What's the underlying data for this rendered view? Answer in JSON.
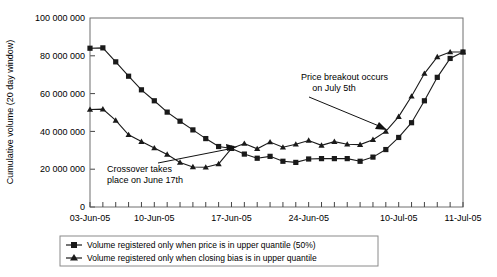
{
  "chart_data": {
    "type": "line",
    "title": "",
    "xlabel": "",
    "ylabel": "Cumulative volume (20 day window)",
    "ylim": [
      0,
      100000000
    ],
    "ytick_labels": [
      "0",
      "20 000 000",
      "40 000 000",
      "60 000 000",
      "80 000 000",
      "100 000 000"
    ],
    "ytick_values": [
      0,
      20000000,
      40000000,
      60000000,
      80000000,
      100000000
    ],
    "xtick_labels": [
      "03-Jun-05",
      "10-Jun-05",
      "17-Jun-05",
      "24-Jun-05",
      "10-Jul-05",
      "11-Jul-05"
    ],
    "xtick_label_indices": [
      0,
      5,
      11,
      17,
      24,
      29
    ],
    "n_ticks": 30,
    "grid": false,
    "legend_position": "below-plot",
    "series": [
      {
        "name": "Volume registered only when price is in upper quantile (50%)",
        "marker": "square",
        "color": "#1a1a1a",
        "values": [
          84000000,
          84200000,
          76800000,
          69200000,
          62000000,
          56200000,
          50200000,
          45400000,
          40800000,
          36200000,
          32000000,
          31000000,
          28000000,
          25800000,
          26800000,
          24200000,
          23600000,
          25400000,
          25600000,
          25600000,
          25600000,
          24200000,
          26400000,
          30400000,
          36800000,
          44600000,
          56200000,
          68600000,
          78600000,
          82000000
        ]
      },
      {
        "name": "Volume registered only when closing bias is in upper quantile",
        "marker": "triangle",
        "color": "#1a1a1a",
        "values": [
          51600000,
          51800000,
          45800000,
          38200000,
          34600000,
          31200000,
          27800000,
          23600000,
          21200000,
          21000000,
          22800000,
          31000000,
          33600000,
          30800000,
          34400000,
          31600000,
          33200000,
          35200000,
          32600000,
          34600000,
          33200000,
          33000000,
          35600000,
          40000000,
          47800000,
          58600000,
          70600000,
          79400000,
          82000000,
          82000000
        ]
      }
    ],
    "annotations": [
      {
        "id": "crossover",
        "text_line1": "Crossover takes",
        "text_line2": "place on June 17th",
        "arrow": "points-right-to-crossover"
      },
      {
        "id": "breakout",
        "text_line1": "Price breakout occurs",
        "text_line2": "on July 5th",
        "arrow": "points-down-right-to-curve"
      }
    ]
  },
  "legend": {
    "items": [
      {
        "label": "Volume registered only when price is in upper quantile (50%)",
        "marker": "square"
      },
      {
        "label": "Volume registered only when closing bias is in upper quantile",
        "marker": "triangle"
      }
    ]
  }
}
